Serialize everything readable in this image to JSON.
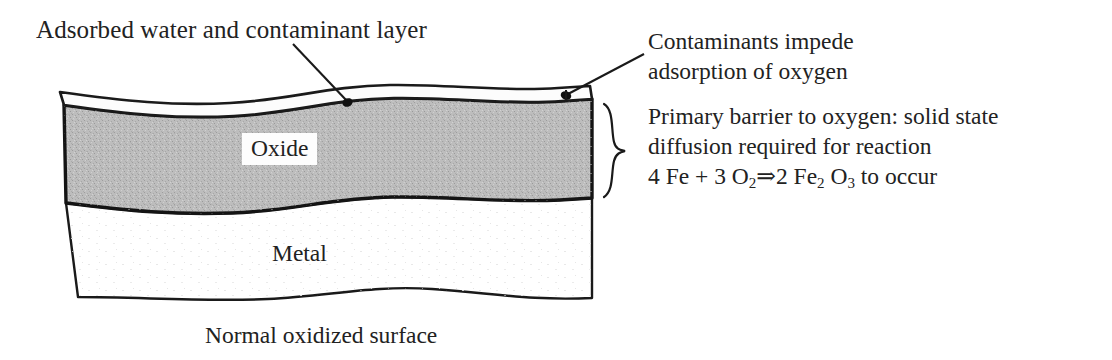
{
  "figure": {
    "caption": "Normal oxidized surface",
    "background_color": "#ffffff",
    "ink_color": "#1a1a1a"
  },
  "annotations": {
    "top_label": "Adsorbed water and contaminant layer",
    "right_callout_1_line1": "Contaminants impede",
    "right_callout_1_line2": "adsorption of oxygen",
    "right_callout_2_line1": "Primary barrier to oxygen: solid state",
    "right_callout_2_line2": "diffusion required for reaction",
    "equation_prefix": "4 Fe + 3 O",
    "equation_sub_1": "2",
    "equation_arrow": "⇒2 Fe",
    "equation_sub_2": "2",
    "equation_mid": " O",
    "equation_sub_3": "3",
    "equation_suffix": " to occur"
  },
  "layers": [
    {
      "name": "contaminant-layer",
      "label": "Adsorbed water and contaminant layer",
      "fill": "#fbfbfb",
      "stroke": "#1a1a1a"
    },
    {
      "name": "oxide-layer",
      "label": "Oxide",
      "fill": "#bdbdbd",
      "stroke": "#141414"
    },
    {
      "name": "metal-layer",
      "label": "Metal",
      "fill": "#ffffff",
      "stroke": "#1a1a1a"
    }
  ],
  "labels": {
    "oxide": "Oxide",
    "metal": "Metal"
  },
  "markers": {
    "leader_dot_left": "contact point on contaminant layer",
    "leader_dot_right": "contact point on contaminant layer",
    "brace": "curly-brace spanning oxide layer"
  }
}
